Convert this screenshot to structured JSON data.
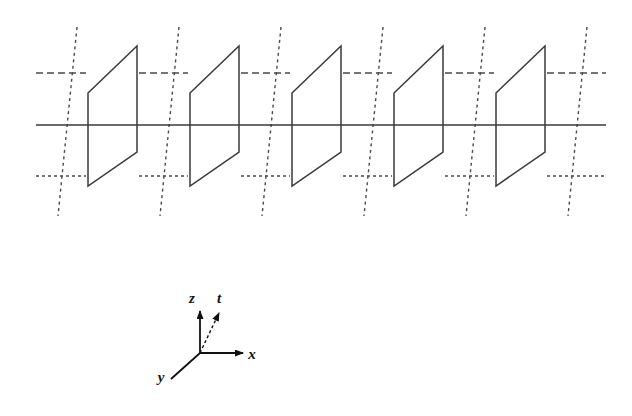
{
  "figure": {
    "background_color": "#ffffff",
    "line_color": "#3a3a3a",
    "dash_color": "#4a4a4a",
    "label_color": "#111111",
    "width": 632,
    "height": 416
  },
  "planes": {
    "count": 5,
    "description": "parallelogram hyperplane",
    "x_positions": [
      88,
      190,
      292,
      394,
      496
    ],
    "geometry": {
      "left_top_y": 93,
      "left_bottom_y": 186,
      "right_top_y": 46,
      "right_bottom_y": 152,
      "width": 49
    }
  },
  "guides": {
    "x_axis_line": {
      "name": "solid-x-axis",
      "y": 125,
      "x_start": 36,
      "x_end": 606,
      "style": "solid"
    },
    "upper_dashed_line": {
      "name": "upper-horizontal-dashed",
      "y": 73,
      "x_start": 36,
      "x_end": 606,
      "style": "dashed"
    },
    "lower_dashed_line": {
      "name": "lower-horizontal-dashed",
      "y": 176,
      "x_start": 36,
      "x_end": 606,
      "style": "dashed"
    },
    "t_lines": {
      "name": "dashed-time-axis-lines",
      "count": 6,
      "top_x_positions": [
        77,
        179,
        281,
        383,
        485,
        587
      ],
      "y_top": 27,
      "y_bottom": 216,
      "x_shift": -19,
      "style": "dotted"
    }
  },
  "legend": {
    "name": "coordinate-axes-legend",
    "origin": {
      "x": 200,
      "y": 353
    },
    "axes": [
      {
        "id": "z",
        "label": "z",
        "style": "solid",
        "arrow": true,
        "tip": {
          "x": 200,
          "y": 311
        },
        "label_pos": {
          "x": 192,
          "y": 303
        }
      },
      {
        "id": "t",
        "label": "t",
        "style": "dashed",
        "arrow": true,
        "tip": {
          "x": 219,
          "y": 313
        },
        "label_pos": {
          "x": 219,
          "y": 303
        }
      },
      {
        "id": "x",
        "label": "x",
        "style": "solid",
        "arrow": true,
        "tip": {
          "x": 243,
          "y": 353
        },
        "label_pos": {
          "x": 252,
          "y": 359
        }
      },
      {
        "id": "y",
        "label": "y",
        "style": "solid",
        "arrow": false,
        "tip": {
          "x": 171,
          "y": 379
        },
        "label_pos": {
          "x": 161,
          "y": 382
        }
      }
    ]
  }
}
